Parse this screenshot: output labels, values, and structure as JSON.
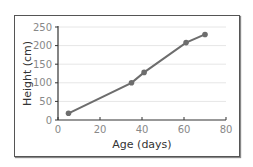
{
  "chart_data": {
    "type": "line",
    "title": "",
    "xlabel": "Age (days)",
    "ylabel": "Height (cm)",
    "x": [
      5,
      35,
      41,
      61,
      70
    ],
    "series": [
      {
        "name": "Height",
        "values": [
          18,
          100,
          128,
          208,
          230
        ]
      }
    ],
    "xlim": [
      0,
      80
    ],
    "ylim": [
      0,
      250
    ],
    "xticks": [
      0,
      20,
      40,
      60,
      80
    ],
    "yticks": [
      0,
      50,
      100,
      150,
      200,
      250
    ],
    "grid": "horizontal",
    "legend": "none",
    "colors": {
      "line": "#6d6d6d",
      "grid": "#e6e6e6",
      "axis": "#333333"
    }
  }
}
